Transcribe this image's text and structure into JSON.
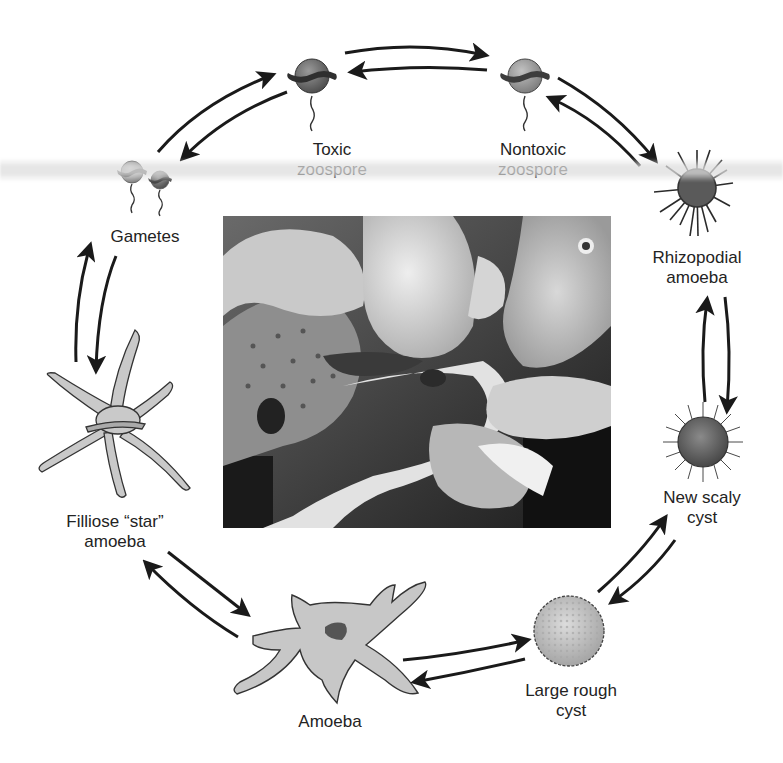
{
  "diagram": {
    "stages": [
      {
        "id": "toxic-zoospore",
        "lines": [
          "Toxic",
          "zoospore"
        ]
      },
      {
        "id": "nontoxic-zoospore",
        "lines": [
          "Nontoxic",
          "zoospore"
        ]
      },
      {
        "id": "rhizopodial-amoeba",
        "lines": [
          "Rhizopodial",
          "amoeba"
        ]
      },
      {
        "id": "new-scaly-cyst",
        "lines": [
          "New scaly",
          "cyst"
        ]
      },
      {
        "id": "large-rough-cyst",
        "lines": [
          "Large rough",
          "cyst"
        ]
      },
      {
        "id": "amoeba",
        "lines": [
          "Amoeba"
        ]
      },
      {
        "id": "filliose-star-amoeba",
        "lines": [
          "Filliose “star”",
          "amoeba"
        ]
      },
      {
        "id": "gametes",
        "lines": [
          "Gametes"
        ]
      }
    ],
    "photo": {
      "description": "Photograph of diseased fish with lesions (grayscale)"
    },
    "colors": {
      "arrow": "#1a1a1a",
      "cell_fill": "#b9b9b9",
      "cell_dark": "#6e6e6e",
      "outline": "#3a3a3a",
      "text": "#232323"
    }
  }
}
